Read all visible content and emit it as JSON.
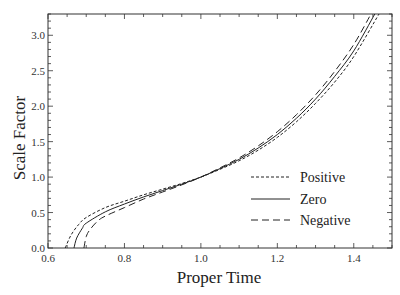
{
  "chart_data": {
    "type": "line",
    "title": "",
    "xlabel": "Proper Time",
    "ylabel": "Scale Factor",
    "xlim": [
      0.6,
      1.5
    ],
    "ylim": [
      0.0,
      3.3
    ],
    "xticks": [
      0.6,
      0.8,
      1.0,
      1.2,
      1.4
    ],
    "xtick_labels": [
      "0.6",
      "0.8",
      "1.0",
      "1.2",
      "1.4"
    ],
    "yticks": [
      0.0,
      0.5,
      1.0,
      1.5,
      2.0,
      2.5,
      3.0
    ],
    "ytick_labels": [
      "0.0",
      "0.5",
      "1.0",
      "1.5",
      "2.0",
      "2.5",
      "3.0"
    ],
    "x_minor_step": 0.05,
    "y_minor_step": 0.1,
    "grid": false,
    "legend_position": "lower right",
    "series": [
      {
        "name": "Positive",
        "style": "dotted-short-dash",
        "x": [
          0.645,
          0.66,
          0.68,
          0.7,
          0.75,
          0.8,
          0.85,
          0.9,
          0.95,
          1.0,
          1.05,
          1.1,
          1.15,
          1.2,
          1.25,
          1.3,
          1.35,
          1.4,
          1.466
        ],
        "y": [
          0.0,
          0.18,
          0.33,
          0.43,
          0.57,
          0.66,
          0.75,
          0.83,
          0.91,
          1.0,
          1.11,
          1.23,
          1.38,
          1.56,
          1.78,
          2.04,
          2.34,
          2.7,
          3.3
        ]
      },
      {
        "name": "Zero",
        "style": "solid",
        "x": [
          0.668,
          0.675,
          0.69,
          0.7,
          0.75,
          0.8,
          0.85,
          0.9,
          0.95,
          1.0,
          1.05,
          1.1,
          1.15,
          1.2,
          1.25,
          1.3,
          1.35,
          1.4,
          1.455
        ],
        "y": [
          0.0,
          0.14,
          0.28,
          0.35,
          0.51,
          0.62,
          0.72,
          0.81,
          0.9,
          1.0,
          1.12,
          1.25,
          1.41,
          1.6,
          1.83,
          2.1,
          2.42,
          2.78,
          3.3
        ]
      },
      {
        "name": "Negative",
        "style": "long-dash",
        "x": [
          0.694,
          0.7,
          0.71,
          0.73,
          0.75,
          0.8,
          0.85,
          0.9,
          0.95,
          1.0,
          1.05,
          1.1,
          1.15,
          1.2,
          1.25,
          1.3,
          1.35,
          1.4,
          1.445
        ],
        "y": [
          0.0,
          0.16,
          0.26,
          0.38,
          0.45,
          0.57,
          0.69,
          0.79,
          0.89,
          1.0,
          1.13,
          1.27,
          1.44,
          1.64,
          1.88,
          2.16,
          2.49,
          2.87,
          3.3
        ]
      }
    ]
  },
  "legend": {
    "items": [
      {
        "label": "Positive",
        "dash": "3,2"
      },
      {
        "label": "Zero",
        "dash": ""
      },
      {
        "label": "Negative",
        "dash": "7,4"
      }
    ]
  },
  "colors": {
    "line": "#222222",
    "axis": "#333333",
    "background": "#ffffff"
  }
}
